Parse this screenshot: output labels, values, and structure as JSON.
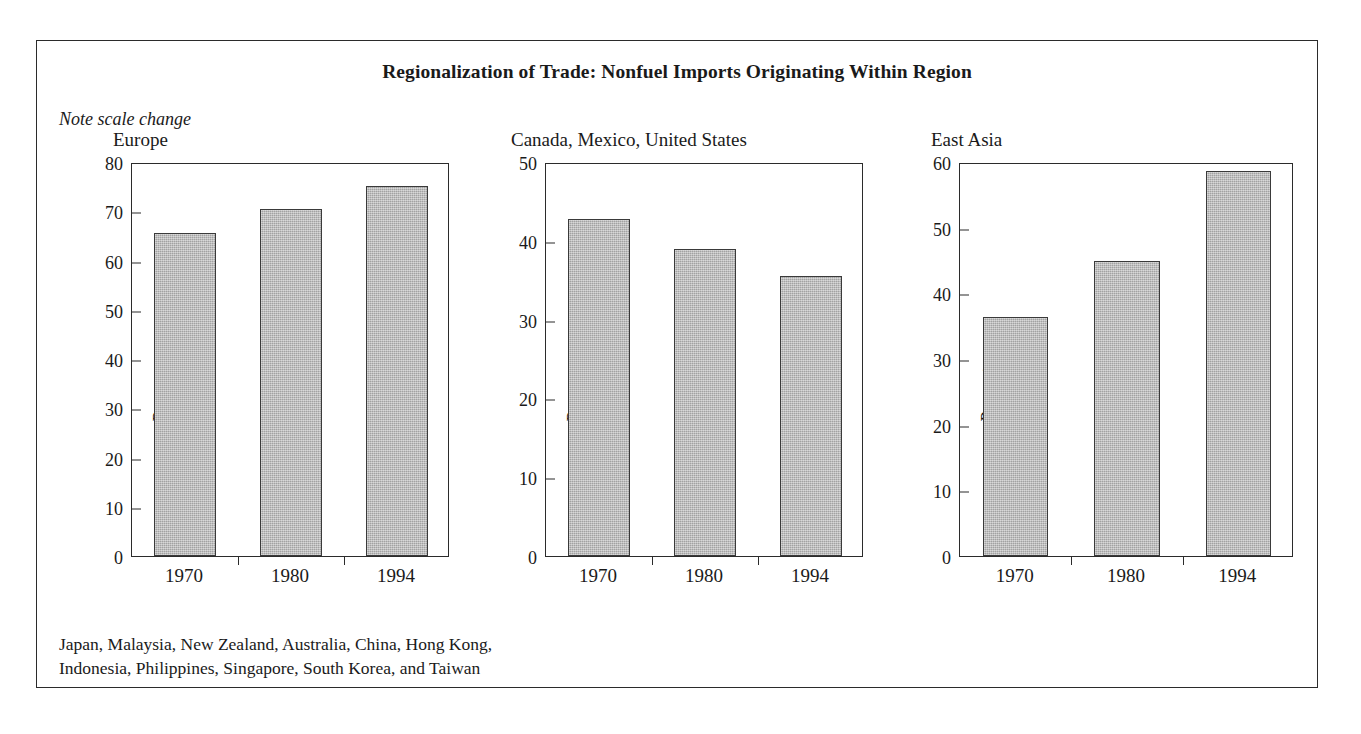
{
  "figure": {
    "title": "Regionalization of Trade: Nonfuel Imports Originating Within Region",
    "note": "Note scale change",
    "footnote_line1": "Japan, Malaysia, New Zealand, Australia, China, Hong Kong,",
    "footnote_line2": "Indonesia, Philippines, Singapore, South Korea, and Taiwan",
    "bar_color": "#b4b4b4",
    "bar_outline_color": "#3a3a3a",
    "frame_color": "#2b2b2b"
  },
  "chart_data": [
    {
      "type": "bar",
      "title": "Europe",
      "categories": [
        "1970",
        "1980",
        "1994"
      ],
      "values": [
        65.6,
        70.4,
        75.1
      ],
      "xlabel": "",
      "ylabel": "Percent",
      "ylim": [
        0,
        80
      ],
      "yticks": [
        0,
        10,
        20,
        30,
        40,
        50,
        60,
        70,
        80
      ],
      "grid": false,
      "legend": "none"
    },
    {
      "type": "bar",
      "title": "Canada, Mexico, United States",
      "categories": [
        "1970",
        "1980",
        "1994"
      ],
      "values": [
        42.8,
        38.9,
        35.5
      ],
      "xlabel": "",
      "ylabel": "Percent",
      "ylim": [
        0,
        50
      ],
      "yticks": [
        0,
        10,
        20,
        30,
        40,
        50
      ],
      "grid": false,
      "legend": "none"
    },
    {
      "type": "bar",
      "title": "East Asia",
      "categories": [
        "1970",
        "1980",
        "1994"
      ],
      "values": [
        36.4,
        44.9,
        58.7
      ],
      "xlabel": "",
      "ylabel": "Percent",
      "ylim": [
        0,
        60
      ],
      "yticks": [
        0,
        10,
        20,
        30,
        40,
        50,
        60
      ],
      "grid": false,
      "legend": "none"
    }
  ]
}
